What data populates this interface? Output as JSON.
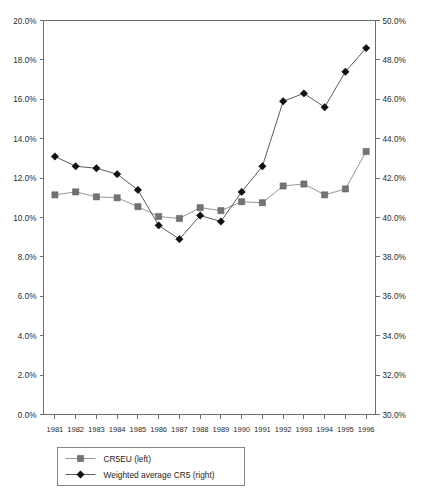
{
  "chart_data": {
    "type": "line",
    "title": "",
    "xlabel": "",
    "ylabel": "",
    "grid": false,
    "legend_position": "bottom-left",
    "categories": [
      "1981",
      "1982",
      "1983",
      "1984",
      "1985",
      "1986",
      "1987",
      "1988",
      "1989",
      "1990",
      "1991",
      "1992",
      "1993",
      "1994",
      "1995",
      "1996"
    ],
    "axes": {
      "left": {
        "label": "",
        "ylim": [
          0.0,
          20.0
        ],
        "tick_step": 2.0,
        "ticks": [
          "0.0%",
          "2.0%",
          "4.0%",
          "6.0%",
          "8.0%",
          "10.0%",
          "12.0%",
          "14.0%",
          "16.0%",
          "18.0%",
          "20.0%"
        ],
        "tick_values": [
          0.0,
          2.0,
          4.0,
          6.0,
          8.0,
          10.0,
          12.0,
          14.0,
          16.0,
          18.0,
          20.0
        ]
      },
      "right": {
        "label": "",
        "ylim": [
          30.0,
          50.0
        ],
        "tick_step": 2.0,
        "ticks": [
          "30.0%",
          "32.0%",
          "34.0%",
          "36.0%",
          "38.0%",
          "40.0%",
          "42.0%",
          "44.0%",
          "46.0%",
          "48.0%",
          "50.0%"
        ],
        "tick_values": [
          30.0,
          32.0,
          34.0,
          36.0,
          38.0,
          40.0,
          42.0,
          44.0,
          46.0,
          48.0,
          50.0
        ]
      }
    },
    "series": [
      {
        "name": "CR5EU (left)",
        "axis": "left",
        "marker": "square",
        "color": "#737373",
        "line_color": "#8a8a8a",
        "values": [
          11.15,
          11.3,
          11.05,
          11.0,
          10.55,
          10.05,
          9.95,
          10.5,
          10.35,
          10.8,
          10.75,
          11.6,
          11.7,
          11.15,
          11.45,
          13.35
        ]
      },
      {
        "name": "Weighted average CR5 (right)",
        "axis": "right",
        "marker": "diamond",
        "color": "#111111",
        "line_color": "#4a4a4a",
        "values": [
          43.1,
          42.6,
          42.5,
          42.2,
          41.4,
          39.6,
          38.9,
          40.1,
          39.8,
          41.3,
          42.6,
          45.9,
          46.3,
          45.6,
          47.4,
          48.6
        ]
      }
    ]
  },
  "legend": {
    "entries": [
      {
        "label": "CR5EU (left)",
        "marker": "square-marker"
      },
      {
        "label": "Weighted average CR5 (right)",
        "marker": "diamond-marker"
      }
    ]
  }
}
